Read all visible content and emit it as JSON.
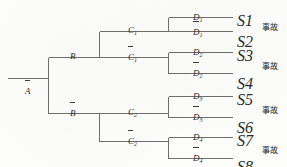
{
  "diagram": {
    "type": "event-tree",
    "title": "",
    "line_color": "#6e6e6e",
    "text_color": "#2a2a2a",
    "background": "#fcfcfb"
  },
  "root": {
    "label": "A",
    "overline": true
  },
  "level1": [
    {
      "label": "B",
      "overline": false
    },
    {
      "label": "B",
      "overline": true
    }
  ],
  "level2": [
    {
      "label": "C",
      "sub": "1",
      "overline": false
    },
    {
      "label": "C",
      "sub": "1",
      "overline": true
    },
    {
      "label": "C",
      "sub": "2",
      "overline": false
    },
    {
      "label": "C",
      "sub": "2",
      "overline": true
    }
  ],
  "level3": [
    {
      "label": "D",
      "sub": "1",
      "overline": false
    },
    {
      "label": "D",
      "sub": "1",
      "overline": true
    },
    {
      "label": "D",
      "sub": "2",
      "overline": false
    },
    {
      "label": "D",
      "sub": "2",
      "overline": true
    },
    {
      "label": "D",
      "sub": "3",
      "overline": false
    },
    {
      "label": "D",
      "sub": "3",
      "overline": true
    },
    {
      "label": "D",
      "sub": "4",
      "overline": false
    },
    {
      "label": "D",
      "sub": "4",
      "overline": true
    }
  ],
  "outcomes": [
    {
      "label": "S",
      "sub": "1"
    },
    {
      "label": "S",
      "sub": "2"
    },
    {
      "label": "S",
      "sub": "3"
    },
    {
      "label": "S",
      "sub": "4"
    },
    {
      "label": "S",
      "sub": "5"
    },
    {
      "label": "S",
      "sub": "6"
    },
    {
      "label": "S",
      "sub": "7"
    },
    {
      "label": "S",
      "sub": "8"
    }
  ],
  "consequences": [
    {
      "text": "事故"
    },
    {
      "text": "事故"
    },
    {
      "text": "事故"
    },
    {
      "text": "事故"
    }
  ]
}
